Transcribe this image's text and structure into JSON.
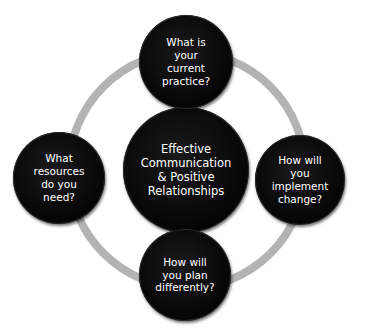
{
  "diagram": {
    "type": "cycle",
    "ring_color": "#b3b3b3",
    "node_color": "#000000",
    "text_color": "#ffffff",
    "center": {
      "label": "Effective\nCommunication\n& Positive\nRelationships"
    },
    "nodes": [
      {
        "position": "top",
        "label": "What is\nyour\ncurrent\npractice?"
      },
      {
        "position": "right",
        "label": "How will\nyou\nimplement\nchange?"
      },
      {
        "position": "bottom",
        "label": "How will\nyou plan\ndifferently?"
      },
      {
        "position": "left",
        "label": "What\nresources\ndo you\nneed?"
      }
    ]
  }
}
